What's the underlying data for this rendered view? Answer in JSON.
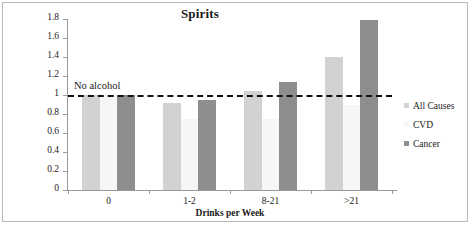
{
  "chart_data": {
    "type": "bar",
    "title": "Spirits",
    "xlabel": "Drinks per Week",
    "ylabel": "Relative Risk",
    "categories": [
      "0",
      "1-2",
      "8-21",
      ">21"
    ],
    "series": [
      {
        "name": "All Causes",
        "color": "#d2d2d2",
        "values": [
          1.0,
          0.92,
          1.04,
          1.4
        ]
      },
      {
        "name": "CVD",
        "color": "#f6f6f6",
        "values": [
          1.0,
          0.75,
          0.75,
          0.9
        ]
      },
      {
        "name": "Cancer",
        "color": "#8e8e8e",
        "values": [
          1.0,
          0.95,
          1.14,
          1.79
        ]
      }
    ],
    "ylim": [
      0,
      1.8
    ],
    "ytick_labels": [
      "0",
      "0.2",
      "0.4",
      "0.6",
      "0.8",
      "1",
      "1.2",
      "1.4",
      "1.6",
      "1.8"
    ],
    "ytick_values": [
      0,
      0.2,
      0.4,
      0.6,
      0.8,
      1.0,
      1.2,
      1.4,
      1.6,
      1.8
    ],
    "grid": false,
    "legend_position": "right",
    "annotations": [
      {
        "text": "No alcohol",
        "value": 1.0,
        "style": "dashed-reference-line",
        "color": "#111111"
      }
    ]
  }
}
